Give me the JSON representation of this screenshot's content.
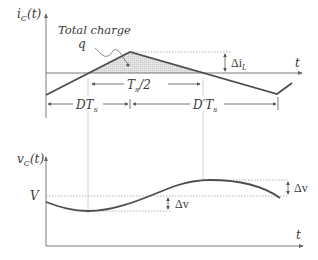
{
  "top_plot": {
    "y_label_main": "i",
    "y_label_sub": "C",
    "y_label_tail": "(t)",
    "x_label": "t",
    "annotation_line1": "Total charge",
    "annotation_line2": "q",
    "ripple_label": "Δi",
    "ripple_sub": "L",
    "half_period_label": "T",
    "half_period_sub": "s",
    "half_period_tail": "/2",
    "dts_label": "DT",
    "dts_sub": "s",
    "dpts_label": "D′T",
    "dpts_sub": "s"
  },
  "bottom_plot": {
    "y_label_main": "v",
    "y_label_sub": "C",
    "y_label_tail": "(t)",
    "x_label": "t",
    "v_label": "V",
    "delta_v_lower": "Δv",
    "delta_v_upper": "Δv"
  },
  "colors": {
    "waveform": "#4d4d4d",
    "shaded_area": "#d9d9d9",
    "axis": "#7a7a7a"
  }
}
